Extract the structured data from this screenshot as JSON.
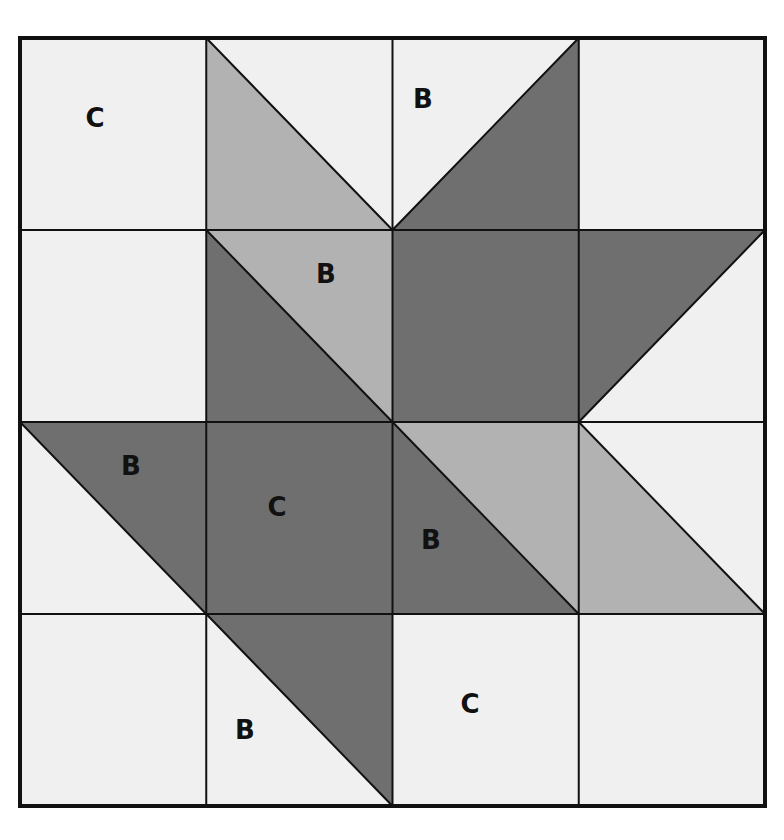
{
  "diagram": {
    "type": "quilt-block",
    "grid": {
      "rows": 4,
      "cols": 4
    },
    "bounds": {
      "x0": 20,
      "y0": 38,
      "x1": 765,
      "y1": 806
    },
    "colors": {
      "background": "#f0f0f0",
      "light_gray": "#b2b2b2",
      "dark_gray": "#6f6f6f",
      "line": "#111111"
    },
    "cells": [
      {
        "row": 0,
        "col": 0,
        "kind": "solid",
        "fill": "background"
      },
      {
        "row": 0,
        "col": 1,
        "kind": "hst",
        "diag": "tl-br",
        "lower_left": "light_gray",
        "upper_right": "background"
      },
      {
        "row": 0,
        "col": 2,
        "kind": "hst",
        "diag": "bl-tr",
        "upper_left": "background",
        "lower_right": "dark_gray"
      },
      {
        "row": 0,
        "col": 3,
        "kind": "solid",
        "fill": "background"
      },
      {
        "row": 1,
        "col": 0,
        "kind": "solid",
        "fill": "background"
      },
      {
        "row": 1,
        "col": 1,
        "kind": "hst",
        "diag": "tl-br",
        "lower_left": "dark_gray",
        "upper_right": "light_gray"
      },
      {
        "row": 1,
        "col": 2,
        "kind": "solid",
        "fill": "dark_gray"
      },
      {
        "row": 1,
        "col": 3,
        "kind": "hst",
        "diag": "bl-tr",
        "upper_left": "dark_gray",
        "lower_right": "background"
      },
      {
        "row": 2,
        "col": 0,
        "kind": "hst",
        "diag": "tl-br",
        "lower_left": "background",
        "upper_right": "dark_gray"
      },
      {
        "row": 2,
        "col": 1,
        "kind": "solid",
        "fill": "dark_gray"
      },
      {
        "row": 2,
        "col": 2,
        "kind": "hst",
        "diag": "tl-br",
        "lower_left": "dark_gray",
        "upper_right": "light_gray"
      },
      {
        "row": 2,
        "col": 3,
        "kind": "hst",
        "diag": "tl-br",
        "lower_left": "light_gray",
        "upper_right": "background"
      },
      {
        "row": 3,
        "col": 0,
        "kind": "solid",
        "fill": "background"
      },
      {
        "row": 3,
        "col": 1,
        "kind": "hst",
        "diag": "tl-br",
        "lower_left": "background",
        "upper_right": "dark_gray"
      },
      {
        "row": 3,
        "col": 2,
        "kind": "solid",
        "fill": "background"
      },
      {
        "row": 3,
        "col": 3,
        "kind": "solid",
        "fill": "background"
      }
    ],
    "labels": [
      {
        "text": "C",
        "x": 95,
        "y": 118
      },
      {
        "text": "B",
        "x": 423,
        "y": 99
      },
      {
        "text": "B",
        "x": 326,
        "y": 274
      },
      {
        "text": "B",
        "x": 131,
        "y": 466
      },
      {
        "text": "C",
        "x": 277,
        "y": 507
      },
      {
        "text": "B",
        "x": 431,
        "y": 540
      },
      {
        "text": "B",
        "x": 245,
        "y": 730
      },
      {
        "text": "C",
        "x": 470,
        "y": 704
      }
    ]
  }
}
